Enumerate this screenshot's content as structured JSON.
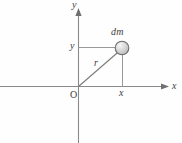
{
  "figure": {
    "background_color": "#fefefe",
    "width": 182,
    "height": 143
  },
  "axes": {
    "x_axis": {
      "label": "x",
      "icon": "arrow-right-icon",
      "color": "#8a8a8a",
      "y_pixel": 86,
      "start_x": 0,
      "end_x": 168
    },
    "y_axis": {
      "label": "y",
      "icon": "arrow-up-icon",
      "color": "#8a8a8a",
      "x_pixel": 78,
      "start_y": 143,
      "end_y": 9
    },
    "origin": {
      "label": "O",
      "x_pixel": 78,
      "y_pixel": 86
    }
  },
  "point": {
    "label": "dm",
    "marker": "filled-circle-marker",
    "fill_color": "#d9d9d9",
    "highlight_color": "#f2f2f2",
    "outline_color": "#6b6b6b",
    "radius": 7,
    "x_pixel": 122,
    "y_pixel": 48
  },
  "annotations": {
    "radius_label": "r",
    "x_coordinate_label": "x",
    "y_coordinate_label": "y"
  },
  "projections": {
    "horizontal": {
      "name": "y-projection-line",
      "from_x": 78,
      "to_x": 122,
      "y": 48,
      "color": "#9a9a9a"
    },
    "vertical": {
      "name": "x-projection-line",
      "x": 122,
      "from_y": 48,
      "to_y": 86,
      "color": "#9a9a9a"
    },
    "radius": {
      "name": "radius-vector-line",
      "from_x": 78,
      "from_y": 86,
      "to_x": 122,
      "to_y": 48,
      "color": "#7d7d7d"
    }
  }
}
